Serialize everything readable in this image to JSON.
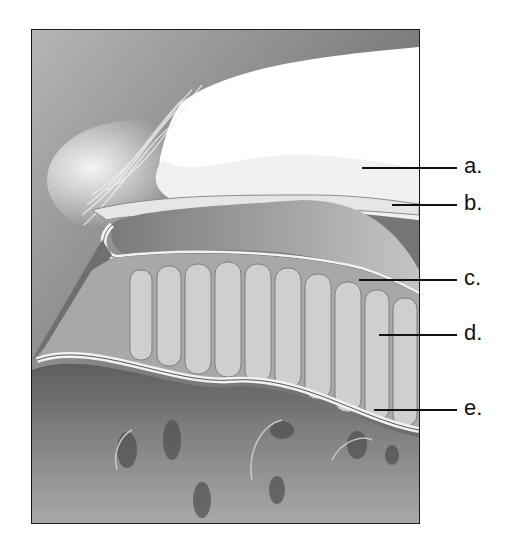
{
  "diagram": {
    "type": "anatomical cross-section illustration",
    "labels": [
      {
        "id": "a",
        "text": "a.",
        "y": 167,
        "line_start_x": 362
      },
      {
        "id": "b",
        "text": "b.",
        "y": 204,
        "line_start_x": 392
      },
      {
        "id": "c",
        "text": "c.",
        "y": 279,
        "line_start_x": 359
      },
      {
        "id": "d",
        "text": "d.",
        "y": 334,
        "line_start_x": 379
      },
      {
        "id": "e",
        "text": "e.",
        "y": 409,
        "line_start_x": 374
      }
    ],
    "colors": {
      "background": "#ffffff",
      "frame_border": "#1a1a1a",
      "leader_line": "#111111",
      "tissue_dark": "#6e6e6e",
      "tissue_mid": "#9a9a9a",
      "tissue_light": "#d8d8d8",
      "highlight": "#ffffff"
    }
  }
}
